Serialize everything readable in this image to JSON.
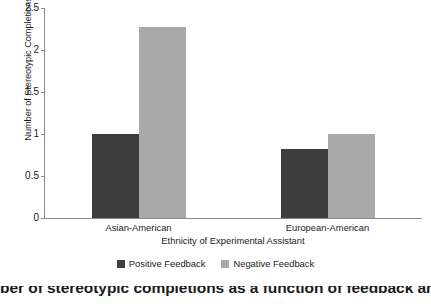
{
  "chart_data": {
    "type": "bar",
    "title": "",
    "xlabel": "Ethnicity of Experimental Assistant",
    "ylabel": "Number of Stereotypic Completions",
    "categories": [
      "Asian-American",
      "European-American"
    ],
    "series": [
      {
        "name": "Positive Feedback",
        "color": "#3d3d3d",
        "values": [
          1.0,
          0.82
        ]
      },
      {
        "name": "Negative Feedback",
        "color": "#a9a9a9",
        "values": [
          2.27,
          1.0
        ]
      }
    ],
    "ylim": [
      0,
      2.5
    ],
    "ytick_labels": [
      "0",
      "0.5",
      "1",
      "1.5",
      "2",
      "2.5"
    ],
    "ytick_values": [
      0,
      0.5,
      1,
      1.5,
      2,
      2.5
    ],
    "grid": false,
    "legend_position": "bottom"
  },
  "caption": {
    "text": "ber of stereotypic completions as a function of feedback and ethnicity"
  }
}
